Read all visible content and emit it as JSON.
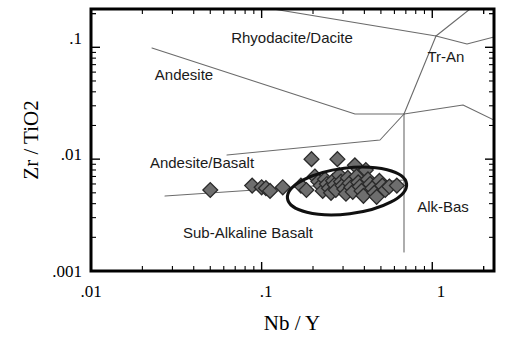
{
  "figure": {
    "title": "",
    "caption": ""
  },
  "axes": {
    "x_title": "Nb / Y",
    "y_title": "Zr / TiO2",
    "x_ticks": [
      ".01",
      ".1",
      "1"
    ],
    "y_ticks": [
      ".1",
      ".01",
      ".001"
    ]
  },
  "fields": [
    {
      "name": "rhyodacite-dacite",
      "label": "Rhyodacite/Dacite",
      "x": 292,
      "y": 43
    },
    {
      "name": "tr-an",
      "label": "Tr-An",
      "x": 446,
      "y": 62
    },
    {
      "name": "andesite",
      "label": "Andesite",
      "x": 184,
      "y": 80
    },
    {
      "name": "andesite-basalt",
      "label": "Andesite/Basalt",
      "x": 202,
      "y": 168
    },
    {
      "name": "alk-bas",
      "label": "Alk-Bas",
      "x": 443,
      "y": 212
    },
    {
      "name": "sub-alkaline-basalt",
      "label": "Sub-Alkaline Basalt",
      "x": 248,
      "y": 238
    }
  ],
  "chart_data": {
    "type": "scatter",
    "xlabel": "Nb / Y",
    "ylabel": "Zr / TiO2",
    "xscale": "log",
    "yscale": "log",
    "xlim": [
      0.01,
      2.3
    ],
    "ylim": [
      0.001,
      0.22
    ],
    "xtick_values": [
      0.01,
      0.1,
      1
    ],
    "xtick_labels": [
      ".01",
      ".1",
      "1"
    ],
    "ytick_values": [
      0.1,
      0.01,
      0.001
    ],
    "ytick_labels": [
      ".1",
      ".01",
      ".001"
    ],
    "grid": false,
    "legend": false,
    "series": [
      {
        "name": "samples",
        "marker": "diamond",
        "marker_fill": "#6e6e6e",
        "marker_edge": "#2a2a2a",
        "points": [
          [
            0.05,
            0.0053
          ],
          [
            0.088,
            0.0058
          ],
          [
            0.1,
            0.0056
          ],
          [
            0.106,
            0.0055
          ],
          [
            0.112,
            0.0052
          ],
          [
            0.133,
            0.0056
          ],
          [
            0.17,
            0.0058
          ],
          [
            0.183,
            0.0053
          ],
          [
            0.196,
            0.01
          ],
          [
            0.205,
            0.007
          ],
          [
            0.215,
            0.0063
          ],
          [
            0.222,
            0.0058
          ],
          [
            0.228,
            0.0052
          ],
          [
            0.235,
            0.0066
          ],
          [
            0.241,
            0.006
          ],
          [
            0.248,
            0.0055
          ],
          [
            0.255,
            0.005
          ],
          [
            0.262,
            0.0064
          ],
          [
            0.268,
            0.0059
          ],
          [
            0.272,
            0.0053
          ],
          [
            0.278,
            0.01
          ],
          [
            0.285,
            0.0072
          ],
          [
            0.292,
            0.0063
          ],
          [
            0.298,
            0.0058
          ],
          [
            0.305,
            0.0054
          ],
          [
            0.312,
            0.0049
          ],
          [
            0.32,
            0.0068
          ],
          [
            0.328,
            0.0061
          ],
          [
            0.335,
            0.0056
          ],
          [
            0.342,
            0.0051
          ],
          [
            0.352,
            0.0088
          ],
          [
            0.36,
            0.007
          ],
          [
            0.368,
            0.0062
          ],
          [
            0.376,
            0.0057
          ],
          [
            0.385,
            0.0052
          ],
          [
            0.395,
            0.0047
          ],
          [
            0.408,
            0.008
          ],
          [
            0.42,
            0.0066
          ],
          [
            0.432,
            0.006
          ],
          [
            0.445,
            0.0055
          ],
          [
            0.458,
            0.005
          ],
          [
            0.472,
            0.0046
          ],
          [
            0.49,
            0.0064
          ],
          [
            0.51,
            0.0058
          ],
          [
            0.53,
            0.0053
          ],
          [
            0.56,
            0.0057
          ],
          [
            0.62,
            0.0058
          ]
        ]
      }
    ],
    "annotations": [
      {
        "name": "cluster-outline",
        "type": "ellipse",
        "description": "hand-drawn ellipse enclosing the main sample cluster"
      },
      {
        "name": "field-boundaries",
        "type": "lines",
        "description": "Winchester & Floyd rock-type field dividing lines"
      }
    ]
  },
  "colors": {
    "frame": "#000000",
    "boundary_line": "#6b6b6b",
    "marker_fill": "#6e6e6e",
    "marker_edge": "#2a2a2a",
    "cluster_outline": "#101010",
    "text": "#000000",
    "background": "#ffffff"
  }
}
